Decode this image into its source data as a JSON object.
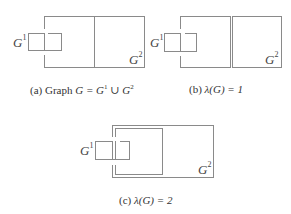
{
  "panels": [
    {
      "id": "a",
      "caption_prefix": "(a) Graph ",
      "caption_math": "G = G",
      "caption_sup1": "1",
      "caption_union": " ∪ ",
      "caption_g2": "G",
      "caption_sup2": "2",
      "labels": {
        "g1": "G",
        "g1_sup": "1",
        "g2": "G",
        "g2_sup": "2"
      }
    },
    {
      "id": "b",
      "caption_prefix": "(b) ",
      "caption_math": "λ(G) = 1",
      "labels": {
        "g1": "G",
        "g1_sup": "1",
        "g2": "G",
        "g2_sup": "2"
      }
    },
    {
      "id": "c",
      "caption_prefix": "(c) ",
      "caption_math": "λ(G) = 2",
      "labels": {
        "g1": "G",
        "g1_sup": "1",
        "g2": "G",
        "g2_sup": "2"
      }
    }
  ],
  "colors": {
    "stroke": "#8a8a8a",
    "background": "#ffffff"
  }
}
